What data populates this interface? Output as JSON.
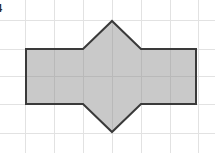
{
  "canvas": {
    "width": 215,
    "height": 153,
    "background_color": "#ffffff"
  },
  "label": {
    "text": "4",
    "note_color": "#2b2b2b"
  },
  "grid": {
    "visible": true,
    "line_color": "#e2e2e2",
    "line_color_over_shape": "#b9b9b9",
    "spacing": 29,
    "vertical_x": [
      25,
      54,
      83,
      112,
      141,
      170,
      198
    ],
    "horizontal_y": [
      20,
      49,
      76,
      104,
      133
    ]
  },
  "shape": {
    "name": "hexagonal-arrow-figure",
    "description": "Rectangle with a triangle pointing up on the top edge and a triangle pointing down on the bottom edge",
    "fill_color": "#c9c9c9",
    "stroke_color": "#3a3a3a",
    "stroke_width": 2,
    "rectangle": {
      "left": 26,
      "top": 49,
      "right": 196,
      "bottom": 104,
      "width": 170,
      "height": 55
    },
    "top_triangle": {
      "base_left_x": 83,
      "base_right_x": 141,
      "base_y": 49,
      "apex_x": 112,
      "apex_y": 21
    },
    "bottom_triangle": {
      "base_left_x": 83,
      "base_right_x": 141,
      "base_y": 104,
      "apex_x": 112,
      "apex_y": 132
    },
    "outline_points": "26,49 83,49 112,21 141,49 196,49 196,104 141,104 112,132 83,104 26,104"
  }
}
